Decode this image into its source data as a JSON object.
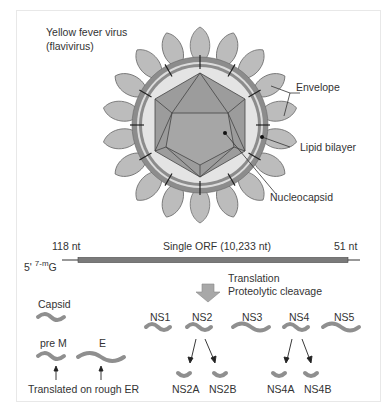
{
  "title": {
    "line1": "Yellow fever virus",
    "line2": "(flavivirus)"
  },
  "virion_labels": {
    "envelope": "Envelope",
    "lipid_bilayer": "Lipid bilayer",
    "nucleocapsid": "Nucleocapsid"
  },
  "genome": {
    "five_prime": "5'",
    "cap_sup": "7-m",
    "cap_base": "G",
    "utr5": "118 nt",
    "orf": "Single ORF (10,233 nt)",
    "utr3": "51 nt"
  },
  "process": {
    "line1": "Translation",
    "line2": "Proteolytic cleavage"
  },
  "structural": {
    "capsid": "Capsid",
    "prem": "pre M",
    "e": "E",
    "note": "Translated on rough ER"
  },
  "nonstructural": {
    "proteins": [
      "NS1",
      "NS2",
      "NS3",
      "NS4",
      "NS5"
    ],
    "cleavage": [
      "NS2A",
      "NS2B",
      "NS4A",
      "NS4B"
    ]
  },
  "colors": {
    "spike_fill": "#b9b9b9",
    "capsid_fill": "#9a9a9a",
    "membrane": "#8c8c8c",
    "inner_ring": "#e2e2e2",
    "protein": "#8f8f8f",
    "text": "#333333"
  }
}
